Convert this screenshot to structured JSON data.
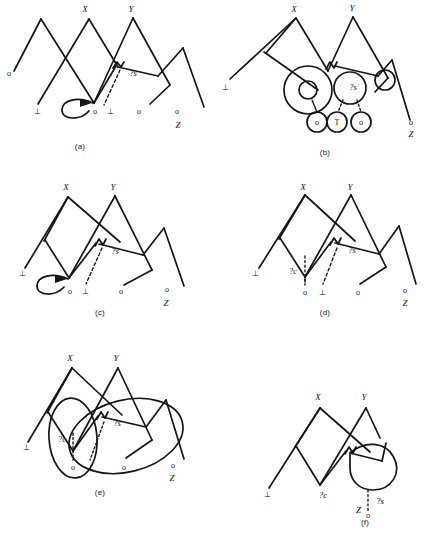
{
  "figure": {
    "background_color": "#ffffff",
    "line_color": "#151515",
    "panel_count": 6
  },
  "captions": [
    {
      "id": "a",
      "label": "(a)"
    },
    {
      "id": "b",
      "label": "(b)"
    },
    {
      "id": "c",
      "label": "(c)"
    },
    {
      "id": "d",
      "label": "(d)"
    },
    {
      "id": "e",
      "label": "(e)"
    },
    {
      "id": "f",
      "label": "(f)"
    }
  ],
  "symbols": {
    "x": "X",
    "y": "Y",
    "z": "Z",
    "bottom": "⊥",
    "circle_node": "o",
    "top": "T",
    "var_c": "?c",
    "var_s": "?s"
  },
  "panels": {
    "a": {
      "caption": "(a)",
      "peak_labels": [
        "X",
        "Y"
      ],
      "leaf_labels": [
        "o",
        "⊥",
        "o",
        "⊥",
        "o",
        "o"
      ],
      "corner_label": "Z",
      "variable_labels": [
        "?s"
      ],
      "features": [
        "self-loop-with-arrow",
        "dashed-edge",
        "zigzag-link"
      ]
    },
    "b": {
      "caption": "(b)",
      "peak_labels": [
        "X",
        "Y"
      ],
      "leaf_labels": [
        "o",
        "T",
        "o",
        "o"
      ],
      "corner_label": "Z",
      "left_label": "⊥",
      "variable_labels": [
        "?s"
      ],
      "features": [
        "circled-nodes",
        "double-circle",
        "crossed-circle",
        "dashed-edges"
      ]
    },
    "c": {
      "caption": "(c)",
      "peak_labels": [
        "X",
        "Y"
      ],
      "leaf_labels": [
        "o",
        "⊥",
        "o",
        "o"
      ],
      "left_label": "⊥",
      "corner_label": "Z",
      "variable_labels": [
        "?s"
      ],
      "features": [
        "self-loop-with-arrow",
        "dashed-edge",
        "zigzag-link"
      ]
    },
    "d": {
      "caption": "(d)",
      "peak_labels": [
        "X",
        "Y"
      ],
      "leaf_labels": [
        "o",
        "⊥",
        "o",
        "o"
      ],
      "left_label": "⊥",
      "corner_label": "Z",
      "variable_labels": [
        "?c",
        "?s"
      ],
      "features": [
        "dashed-edges",
        "zigzag-link"
      ]
    },
    "e": {
      "caption": "(e)",
      "peak_labels": [
        "X",
        "Y"
      ],
      "leaf_labels": [
        "o",
        "⊥",
        "o",
        "o"
      ],
      "left_label": "⊥",
      "corner_label": "Z",
      "variable_labels": [
        "?c",
        "?s"
      ],
      "features": [
        "two-enclosing-ellipses",
        "dashed-edges",
        "zigzag-link"
      ]
    },
    "f": {
      "caption": "(f)",
      "peak_labels": [
        "X",
        "Y"
      ],
      "leaf_labels": [
        "o"
      ],
      "left_label": "⊥",
      "corner_label": "Z",
      "variable_labels": [
        "?c",
        "?s"
      ],
      "features": [
        "closed-blob-region",
        "dashed-edge",
        "zigzag-link"
      ]
    }
  }
}
